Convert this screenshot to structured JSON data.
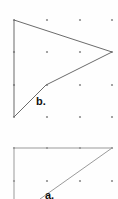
{
  "page": {
    "background_color": "#fefefe",
    "width": 118,
    "height": 199
  },
  "colors": {
    "grid_dot": "#8d8d8d",
    "stroke_dark": "#6b6b6b",
    "stroke_light": "#9a9a9a",
    "label_text": "#111111",
    "background": "#fefefe"
  },
  "grid": {
    "description": "Square array of small dots used as a geoboard/pegboard lattice",
    "dot_radius": 1.1,
    "columns_x": [
      14,
      47,
      80,
      112
    ],
    "top_figure_rows_y": [
      20,
      52,
      85,
      117
    ],
    "bottom_figure_rows_y": [
      148,
      181
    ],
    "spacing_x": 33,
    "spacing_y": 32.5
  },
  "figures": [
    {
      "id": "figure-b",
      "label": "b.",
      "label_x": 36,
      "label_y": 96,
      "shape": "concave arrowhead / dart quadrilateral",
      "stroke": "#6b6b6b",
      "closed": true,
      "vertices": [
        {
          "x": 14,
          "y": 20
        },
        {
          "x": 112,
          "y": 52
        },
        {
          "x": 46,
          "y": 85
        },
        {
          "x": 14,
          "y": 117
        }
      ],
      "points_attr": "14,20 112,52 46,85 14,117"
    },
    {
      "id": "figure-a",
      "label": "a.",
      "label_x": 45,
      "label_y": 190,
      "shape": "right triangle (partially cropped at bottom of image)",
      "stroke": "#9a9a9a",
      "closed": false,
      "vertices": [
        {
          "x": 14,
          "y": 148
        },
        {
          "x": 112,
          "y": 148
        },
        {
          "x": 40,
          "y": 199
        }
      ],
      "points_attr": "112,148 14,148 14,199",
      "diagonal_attr": "112,148 40,199"
    }
  ],
  "labels": {
    "figure_b": "b.",
    "figure_a": "a."
  }
}
